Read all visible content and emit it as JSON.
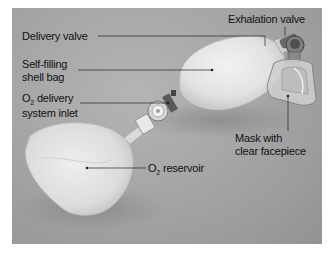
{
  "figure": {
    "labels": {
      "exhalation_valve": "Exhalation valve",
      "delivery_valve": "Delivery valve",
      "shell_bag_line1": "Self-filling",
      "shell_bag_line2": "shell bag",
      "o2_inlet_prefix": "O",
      "o2_inlet_subscript": "2",
      "o2_inlet_line1_rest": " delivery",
      "o2_inlet_line2": "system inlet",
      "mask_line1": "Mask with",
      "mask_line2": "clear facepiece",
      "reservoir_prefix": "O",
      "reservoir_subscript": "2",
      "reservoir_rest": " reservoir"
    },
    "colors": {
      "background": "#a6a6a6",
      "label_text": "#111111",
      "leader_line": "#222222",
      "bag": "#e6e6e6"
    }
  }
}
